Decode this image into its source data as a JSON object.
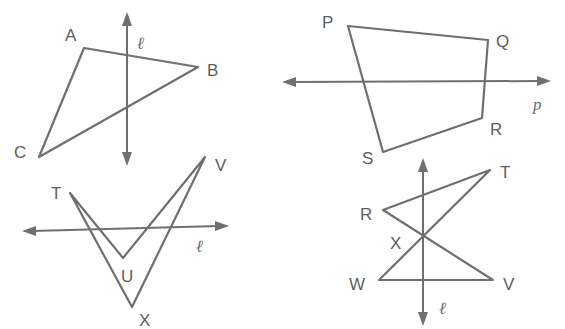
{
  "figures": [
    {
      "id": "triangle-abc",
      "shape": "triangle",
      "vertices": [
        "A",
        "B",
        "C"
      ],
      "line_label": "ℓ",
      "line_orientation": "vertical"
    },
    {
      "id": "quadrilateral-pqrs",
      "shape": "quadrilateral",
      "vertices": [
        "P",
        "Q",
        "R",
        "S"
      ],
      "line_label": "p",
      "line_orientation": "horizontal"
    },
    {
      "id": "dart-tuvx",
      "shape": "concave quadrilateral",
      "vertices": [
        "T",
        "U",
        "V",
        "X"
      ],
      "line_label": "ℓ",
      "line_orientation": "horizontal"
    },
    {
      "id": "bowtie-rtvw",
      "shape": "crossed quadrilateral",
      "vertices": [
        "R",
        "T",
        "V",
        "W"
      ],
      "intersection_label": "X",
      "line_label": "ℓ",
      "line_orientation": "vertical"
    }
  ],
  "labels": {
    "A": "A",
    "B": "B",
    "C": "C",
    "P": "P",
    "Q": "Q",
    "R1": "R",
    "S": "S",
    "T1": "T",
    "U": "U",
    "V1": "V",
    "X1": "X",
    "R2": "R",
    "T2": "T",
    "V2": "V",
    "W": "W",
    "X2": "X",
    "ell1": "ℓ",
    "p": "p",
    "ell2": "ℓ",
    "ell3": "ℓ"
  },
  "colors": {
    "stroke": "#6f6f6f",
    "text": "#5e5e5e",
    "background": "#ffffff"
  }
}
